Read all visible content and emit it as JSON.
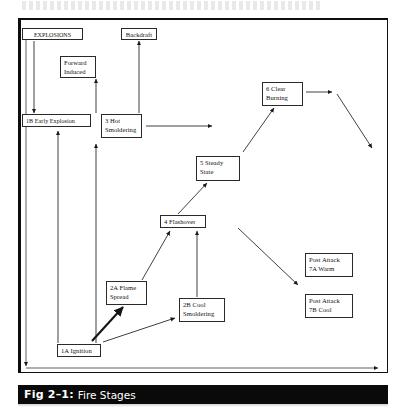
{
  "figure": {
    "number": "Fig 2–1:",
    "title": "Fire Stages"
  },
  "diagram": {
    "type": "flow-diagram",
    "nodes": [
      {
        "id": "explosions",
        "label": "EXPLOSIONS",
        "x": 22,
        "y": 28,
        "w": 61,
        "h": 12,
        "align": "left"
      },
      {
        "id": "backdraft",
        "label": "Backdraft",
        "x": 121,
        "y": 28,
        "w": 36,
        "h": 12,
        "align": "center"
      },
      {
        "id": "forward-induced",
        "label": "Forward\nInduced",
        "x": 60,
        "y": 56,
        "w": 36,
        "h": 22,
        "align": "left"
      },
      {
        "id": "early-explosion",
        "label": "1B Early Explosion",
        "x": 22,
        "y": 114,
        "w": 69,
        "h": 13,
        "align": "left"
      },
      {
        "id": "hot-smoldering",
        "label": "3 Hot\nSmoldering",
        "x": 101,
        "y": 114,
        "w": 41,
        "h": 24,
        "align": "left"
      },
      {
        "id": "clear-burning",
        "label": "6 Clear\nBurning",
        "x": 262,
        "y": 82,
        "w": 41,
        "h": 24,
        "align": "left"
      },
      {
        "id": "steady-state",
        "label": "5 Steady\nState",
        "x": 196,
        "y": 156,
        "w": 44,
        "h": 25,
        "align": "left"
      },
      {
        "id": "flashover",
        "label": "4 Flashover",
        "x": 160,
        "y": 215,
        "w": 46,
        "h": 13,
        "align": "left"
      },
      {
        "id": "flame-spread",
        "label": "2A Flame\nSpread",
        "x": 106,
        "y": 281,
        "w": 41,
        "h": 24,
        "align": "left"
      },
      {
        "id": "cool-smoldering",
        "label": "2B Cool\nSmoldering",
        "x": 179,
        "y": 298,
        "w": 46,
        "h": 24,
        "align": "left"
      },
      {
        "id": "post-attack-warm",
        "label": "Post Attack\n7A Warm",
        "x": 305,
        "y": 253,
        "w": 48,
        "h": 24,
        "align": "left"
      },
      {
        "id": "post-attack-cool",
        "label": "Post Attack\n7B Cool",
        "x": 305,
        "y": 294,
        "w": 48,
        "h": 24,
        "align": "left"
      },
      {
        "id": "ignition",
        "label": "1A Ignition",
        "x": 57,
        "y": 344,
        "w": 44,
        "h": 13,
        "align": "left"
      }
    ],
    "edges": [
      {
        "from": "explosions",
        "to": "early-explosion",
        "style": "thin",
        "shape": "vertical"
      },
      {
        "from": "forward-induced",
        "to": "hot-smoldering",
        "style": "thin",
        "shape": "vertical"
      },
      {
        "from": "hot-smoldering",
        "to": "backdraft",
        "style": "thin",
        "shape": "vertical"
      },
      {
        "from": "flame-spread",
        "to": "early-explosion",
        "style": "thin",
        "shape": "vertical"
      },
      {
        "from": "cool-smoldering",
        "to": "hot-smoldering",
        "style": "thin",
        "shape": "vertical"
      },
      {
        "from": "hot-smoldering",
        "to": "steady-state",
        "style": "thin",
        "shape": "horizontal"
      },
      {
        "from": "ignition",
        "to": "flame-spread",
        "style": "thick",
        "shape": "diagonal"
      },
      {
        "from": "ignition",
        "to": "cool-smoldering",
        "style": "thin",
        "shape": "diagonal"
      },
      {
        "from": "flame-spread",
        "to": "flashover",
        "style": "thin",
        "shape": "diagonal"
      },
      {
        "from": "cool-smoldering",
        "to": "flashover",
        "style": "thin",
        "shape": "vertical"
      },
      {
        "from": "flashover",
        "to": "steady-state",
        "style": "thin",
        "shape": "diagonal"
      },
      {
        "from": "steady-state",
        "to": "clear-burning",
        "style": "thin",
        "shape": "diagonal"
      },
      {
        "from": "clear-burning",
        "to": "post-attack-warm",
        "style": "thin",
        "shape": "diagonal"
      },
      {
        "from": "flashover",
        "to": "post-attack-cool",
        "style": "thin",
        "shape": "diagonal"
      }
    ],
    "axes": [
      {
        "id": "time-axis",
        "orientation": "horizontal"
      },
      {
        "id": "intensity-axis",
        "orientation": "vertical"
      }
    ]
  }
}
